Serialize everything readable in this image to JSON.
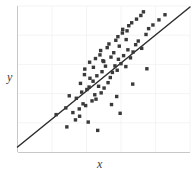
{
  "figure": {
    "width": 194,
    "height": 179,
    "background": "#ffffff"
  },
  "labels": {
    "x_axis": "x",
    "y_axis": "y"
  },
  "style": {
    "axis_color": "#b9b9b9",
    "grid_color": "#efefef",
    "point_color": "#3a3a3a",
    "line_color": "#2e2e2e",
    "label_color": "#3c3c3c",
    "point_size": 1.7,
    "line_width": 1.5,
    "axis_width": 0.8,
    "grid_width": 0.7
  },
  "chart_data": {
    "type": "scatter",
    "title": "",
    "xlabel": "x",
    "ylabel": "y",
    "grid": true,
    "legend": false,
    "xlim": [
      0,
      100
    ],
    "ylim": [
      0,
      100
    ],
    "xticks": [
      20,
      40,
      60,
      80,
      100
    ],
    "yticks": [
      20,
      40,
      60,
      80,
      100
    ],
    "xticklabels": [],
    "yticklabels": [],
    "annotations": [],
    "series": [
      {
        "name": "observations",
        "type": "scatter",
        "marker": "square",
        "color": "#3a3a3a",
        "x": [
          41.0,
          28.6,
          46.5,
          33.6,
          22.4,
          28.0,
          32.1,
          36.0,
          38.0,
          34.1,
          35.8,
          37.2,
          30.0,
          39.5,
          43.2,
          41.5,
          44.8,
          36.5,
          40.2,
          42.0,
          45.5,
          38.8,
          47.0,
          43.8,
          39.0,
          48.5,
          44.0,
          46.0,
          50.2,
          41.8,
          49.0,
          52.5,
          45.2,
          51.0,
          47.8,
          53.8,
          50.0,
          55.0,
          48.2,
          54.2,
          56.5,
          52.0,
          57.8,
          53.0,
          58.5,
          55.8,
          60.0,
          57.0,
          61.5,
          59.0,
          62.8,
          58.2,
          64.0,
          60.8,
          65.5,
          63.0,
          67.0,
          61.0,
          68.5,
          64.5,
          70.0,
          66.2,
          72.0,
          69.0,
          74.5,
          71.5,
          76.0,
          73.0,
          78.5,
          82.0,
          85.5,
          54.5,
          49.5,
          66.8,
          59.5,
          75.0,
          63.5,
          57.5
        ],
        "y": [
          20.5,
          17.2,
          14.8,
          22.0,
          25.6,
          30.2,
          27.0,
          24.5,
          33.0,
          36.8,
          29.5,
          41.0,
          38.5,
          31.8,
          35.0,
          44.5,
          39.2,
          47.0,
          42.8,
          50.5,
          36.2,
          53.0,
          45.0,
          48.5,
          56.8,
          40.5,
          58.0,
          52.2,
          43.8,
          61.5,
          55.0,
          47.5,
          64.0,
          58.8,
          66.5,
          51.0,
          62.0,
          54.5,
          69.5,
          65.0,
          59.0,
          71.5,
          56.0,
          74.0,
          63.5,
          68.0,
          60.5,
          76.5,
          66.0,
          72.5,
          58.5,
          79.0,
          70.0,
          81.5,
          64.5,
          77.0,
          68.5,
          84.0,
          73.5,
          86.5,
          76.0,
          88.5,
          71.0,
          91.0,
          80.5,
          93.5,
          84.5,
          96.0,
          87.0,
          90.5,
          94.0,
          32.5,
          62.5,
          46.5,
          26.5,
          57.0,
          83.0,
          38.0
        ]
      },
      {
        "name": "fit-line",
        "type": "line",
        "color": "#2e2e2e",
        "x": [
          0.0,
          100.0
        ],
        "y": [
          3.4,
          99.3
        ]
      }
    ]
  }
}
